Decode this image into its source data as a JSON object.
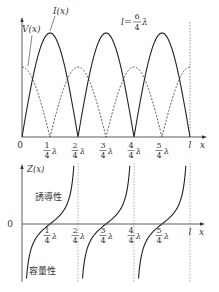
{
  "top_plot": {
    "y_labels": {
      "current": "I(x)",
      "voltage": "V(x)"
    },
    "length_annotation": {
      "prefix": "l=",
      "num": "6",
      "den": "4",
      "suffix": "λ"
    },
    "origin_label": "0",
    "x_axis_label": "x",
    "end_label": "l",
    "ticks": [
      {
        "num": "1",
        "den": "4",
        "unit": "λ"
      },
      {
        "num": "2",
        "den": "4",
        "unit": "λ"
      },
      {
        "num": "3",
        "den": "4",
        "unit": "λ"
      },
      {
        "num": "4",
        "den": "4",
        "unit": "λ"
      },
      {
        "num": "5",
        "den": "4",
        "unit": "λ"
      }
    ]
  },
  "bottom_plot": {
    "y_label": "Z(x)",
    "zero_label": "0",
    "x_axis_label": "x",
    "end_label": "l",
    "inductive_label": "誘導性",
    "capacitive_label": "容量性",
    "ticks": [
      {
        "num": "1",
        "den": "4",
        "unit": "λ"
      },
      {
        "num": "2",
        "den": "4",
        "unit": "λ"
      },
      {
        "num": "3",
        "den": "4",
        "unit": "λ"
      },
      {
        "num": "4",
        "den": "4",
        "unit": "λ"
      },
      {
        "num": "5",
        "den": "4",
        "unit": "λ"
      }
    ]
  }
}
